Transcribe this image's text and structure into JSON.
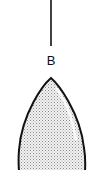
{
  "diagram": {
    "label": "B",
    "colors": {
      "stroke": "#111111",
      "fill": "#d9d9d9",
      "background": "#ffffff"
    },
    "elements": [
      {
        "type": "leader-line",
        "description": "vertical pointer line"
      },
      {
        "type": "text-label",
        "text": "B"
      },
      {
        "type": "teardrop-shape",
        "description": "stippled teardrop with highlight"
      }
    ]
  }
}
